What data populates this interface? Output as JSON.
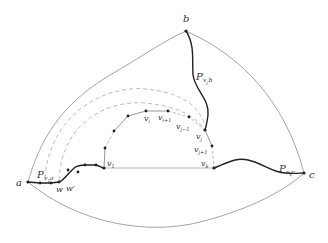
{
  "diagram": {
    "labels": {
      "a": "a",
      "b": "b",
      "c": "c",
      "P_v1a_main": "P",
      "P_v1a_sub": "v",
      "P_v1a_subsub": "1",
      "P_v1a_subtail": "a",
      "P_vjb_main": "P",
      "P_vjb_sub": "v",
      "P_vjb_subsub": "j",
      "P_vjb_subtail": "b",
      "P_vkc_main": "P",
      "P_vkc_sub": "v",
      "P_vkc_subsub": "k",
      "P_vkc_subtail": "c",
      "w": "w",
      "w_prime": "w′",
      "v1_main": "v",
      "v1_sub": "1",
      "vi_main": "v",
      "vi_sub": "i",
      "vi1_main": "v",
      "vi1_sub": "i+1",
      "vj_1_main": "v",
      "vj_1_sub": "j−1",
      "vj_main": "v",
      "vj_sub": "j",
      "vj1_main": "v",
      "vj1_sub": "j+1",
      "vk_main": "v",
      "vk_sub": "k"
    },
    "colors": {
      "outer_edge": "#9a9a9a",
      "bold_path": "#222222",
      "dashed": "#aaaaaa",
      "chain": "#888888",
      "vertex": "#222222"
    }
  }
}
